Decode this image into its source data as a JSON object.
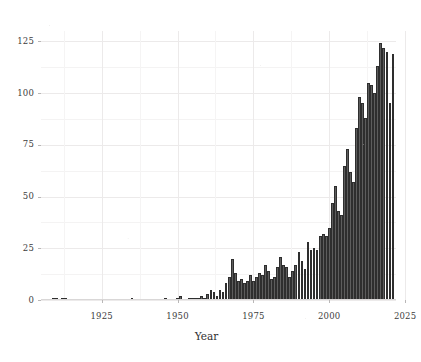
{
  "chart_data": {
    "type": "bar",
    "title": "",
    "subtitle": "",
    "xlabel": "Year",
    "ylabel": "",
    "xlim": [
      1905,
      2022
    ],
    "ylim": [
      0,
      130
    ],
    "grid": true,
    "legend": null,
    "x_ticks": [
      "1925",
      "1950",
      "1975",
      "2000",
      "2025"
    ],
    "x_tick_values": [
      1925,
      1950,
      1975,
      2000,
      2025
    ],
    "y_ticks": [
      "0",
      "25",
      "50",
      "75",
      "100",
      "125"
    ],
    "y_tick_values": [
      0,
      25,
      50,
      75,
      100,
      125
    ],
    "bar_color": "#5d5d5d",
    "bar_edge_color": "#2e2e2e",
    "background_color": "#ffffff",
    "grid_color": "#eceaea",
    "categories": [
      1909,
      1910,
      1912,
      1913,
      1935,
      1946,
      1950,
      1951,
      1954,
      1955,
      1956,
      1957,
      1958,
      1959,
      1960,
      1961,
      1962,
      1963,
      1964,
      1965,
      1966,
      1967,
      1968,
      1969,
      1970,
      1971,
      1972,
      1973,
      1974,
      1975,
      1976,
      1977,
      1978,
      1979,
      1980,
      1981,
      1982,
      1983,
      1984,
      1985,
      1986,
      1987,
      1988,
      1989,
      1990,
      1991,
      1992,
      1993,
      1994,
      1995,
      1996,
      1997,
      1998,
      1999,
      2000,
      2001,
      2002,
      2003,
      2004,
      2005,
      2006,
      2007,
      2008,
      2009,
      2010,
      2011,
      2012,
      2013,
      2014,
      2015,
      2016,
      2017,
      2018,
      2019,
      2020,
      2021
    ],
    "values": [
      1,
      1,
      1,
      1,
      1,
      1,
      1,
      2,
      1,
      1,
      1,
      1,
      2,
      1,
      3,
      5,
      4,
      2,
      5,
      4,
      8,
      11,
      20,
      13,
      9,
      10,
      8,
      9,
      12,
      9,
      11,
      13,
      12,
      17,
      14,
      10,
      11,
      16,
      21,
      17,
      16,
      11,
      14,
      17,
      23,
      19,
      15,
      28,
      24,
      25,
      24,
      31,
      32,
      31,
      35,
      47,
      55,
      43,
      41,
      65,
      73,
      62,
      57,
      83,
      98,
      95,
      88,
      105,
      104,
      100,
      113,
      124,
      122,
      120,
      95,
      119
    ]
  },
  "axes": {
    "x_axis_label": "Year",
    "x_tick_labels": [
      "1925",
      "1950",
      "1975",
      "2000",
      "2025"
    ],
    "y_tick_labels": [
      "125",
      "100",
      "75",
      "50",
      "25",
      "0"
    ]
  }
}
